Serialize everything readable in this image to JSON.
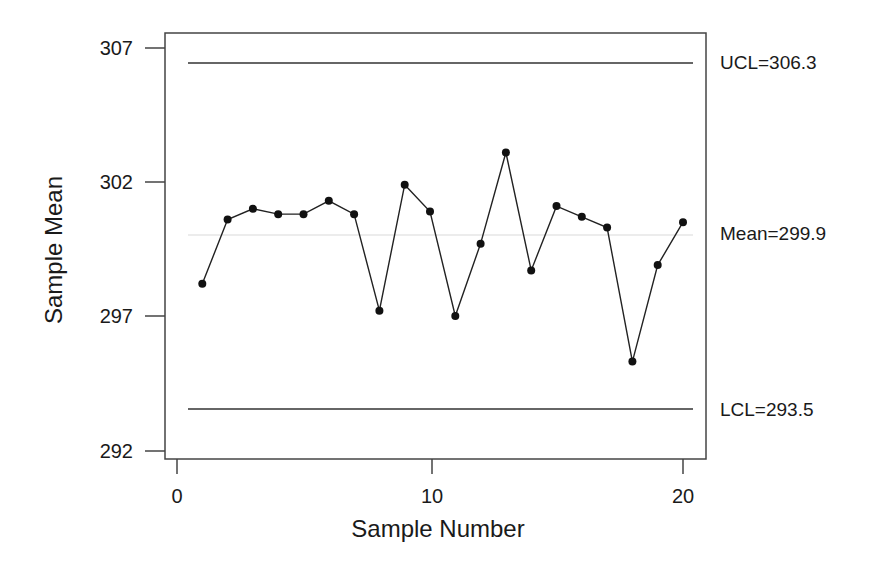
{
  "chart_data": {
    "type": "line",
    "title": "",
    "xlabel": "Sample Number",
    "ylabel": "Sample Mean",
    "xlim": [
      0,
      21
    ],
    "ylim": [
      291.8,
      307.6
    ],
    "x_ticks": [
      0,
      10,
      20
    ],
    "y_ticks": [
      292,
      297,
      302,
      307
    ],
    "grid": false,
    "legend": null,
    "x": [
      1,
      2,
      3,
      4,
      5,
      6,
      7,
      8,
      9,
      10,
      11,
      12,
      13,
      14,
      15,
      16,
      17,
      18,
      19,
      20
    ],
    "series": [
      {
        "name": "Sample Mean",
        "values": [
          298.2,
          300.6,
          301.0,
          300.8,
          300.8,
          301.3,
          300.8,
          297.2,
          301.9,
          300.9,
          297.0,
          299.7,
          303.1,
          298.7,
          301.1,
          300.7,
          300.3,
          295.3,
          298.9,
          300.5
        ],
        "marker": "circle",
        "color": "#111111"
      }
    ],
    "reference_lines": [
      {
        "name": "UCL",
        "value": 306.3,
        "label": "UCL=306.3",
        "color": "#333333"
      },
      {
        "name": "Mean",
        "value": 299.9,
        "label": "Mean=299.9",
        "color": "#d9d9d9"
      },
      {
        "name": "LCL",
        "value": 293.5,
        "label": "LCL=293.5",
        "color": "#333333"
      }
    ]
  },
  "labels": {
    "xlabel": "Sample Number",
    "ylabel": "Sample Mean",
    "ucl": "UCL=306.3",
    "mean": "Mean=299.9",
    "lcl": "LCL=293.5",
    "x_ticks": [
      "0",
      "10",
      "20"
    ],
    "y_ticks": [
      "307",
      "302",
      "297",
      "292"
    ]
  }
}
